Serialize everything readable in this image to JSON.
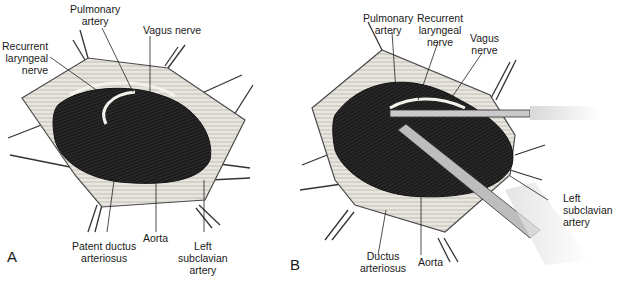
{
  "panels": [
    {
      "id": "A",
      "letter": "A",
      "labels": {
        "pulmonary_artery": [
          "Pulmonary",
          "artery"
        ],
        "vagus_nerve": [
          "Vagus nerve"
        ],
        "recurrent_laryngeal_nerve": [
          "Recurrent",
          "laryngeal",
          "nerve"
        ],
        "patent_ductus_arteriosus": [
          "Patent ductus",
          "arteriosus"
        ],
        "aorta": [
          "Aorta"
        ],
        "left_subclavian_artery": [
          "Left",
          "subclavian",
          "artery"
        ]
      }
    },
    {
      "id": "B",
      "letter": "B",
      "labels": {
        "pulmonary_artery": [
          "Pulmonary",
          "artery"
        ],
        "recurrent_laryngeal_nerve": [
          "Recurrent",
          "laryngeal",
          "nerve"
        ],
        "vagus_nerve": [
          "Vagus",
          "nerve"
        ],
        "ductus_arteriosus": [
          "Ductus",
          "arteriosus"
        ],
        "aorta": [
          "Aorta"
        ],
        "left_subclavian_artery": [
          "Left",
          "subclavian",
          "artery"
        ]
      }
    }
  ]
}
